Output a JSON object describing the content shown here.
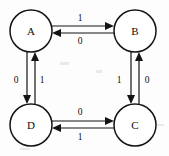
{
  "diagram": {
    "type": "state-transition-diagram",
    "title": "",
    "background_color": "#fdfdfd",
    "stroke_color": "#141414",
    "nodes": [
      {
        "id": "A",
        "label": "A",
        "cx": 31,
        "cy": 31,
        "r": 21
      },
      {
        "id": "B",
        "label": "B",
        "cx": 135,
        "cy": 31,
        "r": 21
      },
      {
        "id": "C",
        "label": "C",
        "cx": 135,
        "cy": 125,
        "r": 21
      },
      {
        "id": "D",
        "label": "D",
        "cx": 31,
        "cy": 125,
        "r": 21
      }
    ],
    "edges": [
      {
        "id": "a-to-b",
        "from": "A",
        "to": "B",
        "label": "1",
        "label_x": 80,
        "label_y": 18,
        "direction": "right"
      },
      {
        "id": "b-to-a",
        "from": "B",
        "to": "A",
        "label": "0",
        "label_x": 80,
        "label_y": 41,
        "direction": "left"
      },
      {
        "id": "a-to-d",
        "from": "A",
        "to": "D",
        "label": "0",
        "label_x": 16,
        "label_y": 80,
        "direction": "down"
      },
      {
        "id": "d-to-a",
        "from": "D",
        "to": "A",
        "label": "1",
        "label_x": 42,
        "label_y": 80,
        "direction": "up"
      },
      {
        "id": "b-to-c",
        "from": "B",
        "to": "C",
        "label": "1",
        "label_x": 119,
        "label_y": 80,
        "direction": "down"
      },
      {
        "id": "c-to-b",
        "from": "C",
        "to": "B",
        "label": "0",
        "label_x": 147,
        "label_y": 80,
        "direction": "up"
      },
      {
        "id": "d-to-c",
        "from": "D",
        "to": "C",
        "label": "0",
        "label_x": 80,
        "label_y": 112,
        "direction": "right"
      },
      {
        "id": "c-to-d",
        "from": "C",
        "to": "D",
        "label": "1",
        "label_x": 80,
        "label_y": 137,
        "direction": "left"
      }
    ]
  }
}
